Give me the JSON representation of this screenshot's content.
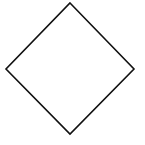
{
  "diagram": {
    "shape": "diamond",
    "stroke_color": "#111111",
    "fill_color": "#ffffff",
    "background": "#ffffff",
    "stroke_width": 1.6,
    "vertices": {
      "top": [
        70,
        3
      ],
      "right": [
        134,
        69
      ],
      "bottom": [
        70,
        134
      ],
      "left": [
        6,
        69
      ]
    },
    "points": "70,3 134,69 70,134 6,69"
  }
}
